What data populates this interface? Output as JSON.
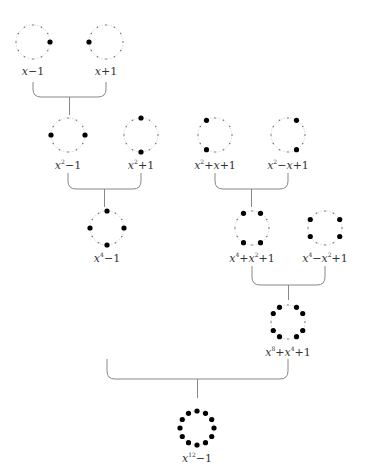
{
  "diagram": {
    "title": "",
    "circle_ticks": 12,
    "colors": {
      "circle": "#999999",
      "tick": "#777777",
      "root": "#000000",
      "bracket": "#888888"
    },
    "nodes": [
      {
        "id": "n1",
        "label": "x−1",
        "html": "<i>x</i><span class='op'>−1</span>",
        "cx": 33,
        "cy": 42,
        "roots": [
          0
        ]
      },
      {
        "id": "n2",
        "label": "x+1",
        "html": "<i>x</i><span class='op'>+1</span>",
        "cx": 106,
        "cy": 42,
        "roots": [
          6
        ]
      },
      {
        "id": "n3",
        "label": "x²−1",
        "html": "<i>x</i><sup>2</sup><span class='op'>−1</span>",
        "cx": 68,
        "cy": 135,
        "roots": [
          0,
          6
        ]
      },
      {
        "id": "n4",
        "label": "x²+1",
        "html": "<i>x</i><sup>2</sup><span class='op'>+1</span>",
        "cx": 141,
        "cy": 135,
        "roots": [
          3,
          9
        ]
      },
      {
        "id": "n5",
        "label": "x²+x+1",
        "html": "<i>x</i><sup>2</sup><span class='op'>+</span><i>x</i><span class='op'>+1</span>",
        "cx": 215,
        "cy": 135,
        "roots": [
          4,
          8
        ]
      },
      {
        "id": "n6",
        "label": "x²−x+1",
        "html": "<i>x</i><sup>2</sup><span class='op'>−</span><i>x</i><span class='op'>+1</span>",
        "cx": 288,
        "cy": 135,
        "roots": [
          2,
          10
        ]
      },
      {
        "id": "n7",
        "label": "x⁴−1",
        "html": "<i>x</i><sup>4</sup><span class='op'>−1</span>",
        "cx": 107,
        "cy": 228,
        "roots": [
          0,
          3,
          6,
          9
        ]
      },
      {
        "id": "n8",
        "label": "x⁴+x²+1",
        "html": "<i>x</i><sup>4</sup><span class='op'>+</span><i>x</i><sup>2</sup><span class='op'>+1</span>",
        "cx": 252,
        "cy": 228,
        "roots": [
          2,
          4,
          8,
          10
        ]
      },
      {
        "id": "n9",
        "label": "x⁴−x²+1",
        "html": "<i>x</i><sup>4</sup><span class='op'>−</span><i>x</i><sup>2</sup><span class='op'>+1</span>",
        "cx": 325,
        "cy": 228,
        "roots": [
          1,
          5,
          7,
          11
        ]
      },
      {
        "id": "n10",
        "label": "x⁸+x⁴+1",
        "html": "<i>x</i><sup>8</sup><span class='op'>+</span><i>x</i><sup>4</sup><span class='op'>+1</span>",
        "cx": 288,
        "cy": 322,
        "roots": [
          1,
          2,
          4,
          5,
          7,
          8,
          10,
          11
        ]
      },
      {
        "id": "n11",
        "label": "x¹²−1",
        "html": "<i>x</i><sup>12</sup><span class='op'>−1</span>",
        "cx": 197,
        "cy": 428,
        "roots": [
          0,
          1,
          2,
          3,
          4,
          5,
          6,
          7,
          8,
          9,
          10,
          11
        ]
      }
    ],
    "brackets": [
      {
        "from": [
          "n1",
          "n2"
        ],
        "x1": 33,
        "x2": 106,
        "top": 82,
        "bottom": 97,
        "stem_to": 115
      },
      {
        "from": [
          "n3",
          "n4"
        ],
        "x1": 68,
        "x2": 141,
        "top": 173,
        "bottom": 189,
        "stem_to": 207
      },
      {
        "from": [
          "n5",
          "n6"
        ],
        "x1": 215,
        "x2": 288,
        "top": 173,
        "bottom": 189,
        "stem_to": 207
      },
      {
        "from": [
          "n8",
          "n9"
        ],
        "x1": 252,
        "x2": 325,
        "top": 266,
        "bottom": 285,
        "stem_to": 300
      },
      {
        "from": [
          "n7",
          "n10"
        ],
        "x1": 107,
        "x2": 288,
        "top": 359,
        "bottom": 379,
        "stem_to": 398
      }
    ],
    "radius": 17,
    "label_offset": 23
  }
}
